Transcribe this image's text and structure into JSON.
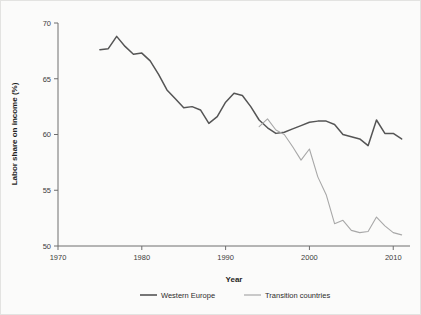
{
  "chart_data": {
    "type": "line",
    "title": "",
    "xlabel": "Year",
    "ylabel": "Labor share on income (%)",
    "xlim": [
      1970,
      2012
    ],
    "ylim": [
      50,
      70
    ],
    "xticks": [
      1970,
      1980,
      1990,
      2000,
      2010
    ],
    "xtick_labels": [
      "1970",
      "1980",
      "1990",
      "2000",
      "2010"
    ],
    "yticks": [
      50,
      55,
      60,
      65,
      70
    ],
    "ytick_labels": [
      "50",
      "55",
      "60",
      "65",
      "70"
    ],
    "grid": false,
    "legend_position": "bottom",
    "series": [
      {
        "name": "Western Europe",
        "color": "#555555",
        "x": [
          1975,
          1976,
          1977,
          1978,
          1979,
          1980,
          1981,
          1982,
          1983,
          1984,
          1985,
          1986,
          1987,
          1988,
          1989,
          1990,
          1991,
          1992,
          1993,
          1994,
          1995,
          1996,
          1997,
          1998,
          1999,
          2000,
          2001,
          2002,
          2003,
          2004,
          2005,
          2006,
          2007,
          2008,
          2009,
          2010,
          2011
        ],
        "values": [
          67.6,
          67.7,
          68.8,
          67.9,
          67.2,
          67.3,
          66.6,
          65.4,
          64.0,
          63.2,
          62.4,
          62.5,
          62.2,
          61.0,
          61.6,
          62.9,
          63.7,
          63.5,
          62.5,
          61.3,
          60.6,
          60.1,
          60.2,
          60.5,
          60.8,
          61.1,
          61.2,
          61.2,
          60.9,
          60.0,
          59.8,
          59.6,
          59.0,
          61.3,
          60.1,
          60.1,
          59.6
        ]
      },
      {
        "name": "Transition countries",
        "color": "#a8a8a8",
        "x": [
          1994,
          1995,
          1996,
          1997,
          1998,
          1999,
          2000,
          2001,
          2002,
          2003,
          2004,
          2005,
          2006,
          2007,
          2008,
          2009,
          2010,
          2011
        ],
        "values": [
          60.7,
          61.4,
          60.4,
          60.0,
          58.9,
          57.7,
          58.7,
          56.2,
          54.6,
          52.0,
          52.3,
          51.4,
          51.2,
          51.3,
          52.6,
          51.8,
          51.2,
          51.0
        ]
      }
    ]
  },
  "legend": {
    "items": [
      {
        "label": "Western Europe",
        "color": "#555555"
      },
      {
        "label": "Transition countries",
        "color": "#a8a8a8"
      }
    ]
  }
}
